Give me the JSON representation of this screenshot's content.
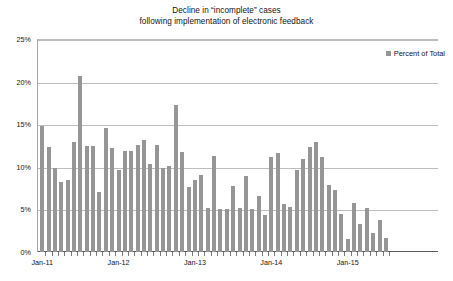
{
  "chart_data": {
    "type": "bar",
    "title": "Decline in “incomplete” cases following implementation of electronic feedback",
    "title_lines": [
      "Decline in “incomplete” cases",
      "following implementation of electronic feedback"
    ],
    "xlabel": "",
    "ylabel": "",
    "ylim": [
      0,
      25
    ],
    "ytick_labels": [
      "0%",
      "5%",
      "10%",
      "15%",
      "20%",
      "25%"
    ],
    "ytick_values": [
      0,
      5,
      10,
      15,
      20,
      25
    ],
    "xtick_labels": [
      "Jan-11",
      "Jan-12",
      "Jan-13",
      "Jan-14",
      "Jan-15"
    ],
    "xtick_positions": [
      0,
      12,
      24,
      36,
      48
    ],
    "grid": true,
    "legend_position": "top-right",
    "series": [
      {
        "name": "Percent of Total",
        "color": "#969696",
        "categories": [
          "Jan-11",
          "Feb-11",
          "Mar-11",
          "Apr-11",
          "May-11",
          "Jun-11",
          "Jul-11",
          "Aug-11",
          "Sep-11",
          "Oct-11",
          "Nov-11",
          "Dec-11",
          "Jan-12",
          "Feb-12",
          "Mar-12",
          "Apr-12",
          "May-12",
          "Jun-12",
          "Jul-12",
          "Aug-12",
          "Sep-12",
          "Oct-12",
          "Nov-12",
          "Dec-12",
          "Jan-13",
          "Feb-13",
          "Mar-13",
          "Apr-13",
          "May-13",
          "Jun-13",
          "Jul-13",
          "Aug-13",
          "Sep-13",
          "Oct-13",
          "Nov-13",
          "Dec-13",
          "Jan-14",
          "Feb-14",
          "Mar-14",
          "Apr-14",
          "May-14",
          "Jun-14",
          "Jul-14",
          "Aug-14",
          "Sep-14",
          "Oct-14",
          "Nov-14",
          "Dec-14",
          "Jan-15",
          "Feb-15",
          "Mar-15",
          "Apr-15",
          "May-15",
          "Jun-15",
          "Jul-15",
          "Aug-15",
          "Sep-15"
        ],
        "values": [
          14.8,
          12.3,
          9.9,
          8.2,
          8.4,
          12.9,
          20.7,
          12.5,
          12.5,
          7.0,
          14.6,
          12.2,
          9.6,
          11.8,
          11.9,
          12.6,
          13.1,
          10.3,
          12.6,
          9.9,
          10.1,
          17.2,
          11.7,
          7.6,
          8.5,
          9.0,
          5.2,
          11.3,
          5.0,
          5.0,
          7.7,
          5.2,
          8.9,
          5.1,
          6.6,
          4.4,
          11.2,
          11.6,
          5.6,
          5.3,
          9.6,
          10.9,
          12.3,
          12.9,
          11.1,
          7.9,
          7.3,
          4.5,
          1.5,
          5.7,
          3.3,
          5.2,
          2.2,
          3.8,
          1.6
        ]
      }
    ]
  },
  "legend": {
    "label": "Percent of Total"
  }
}
